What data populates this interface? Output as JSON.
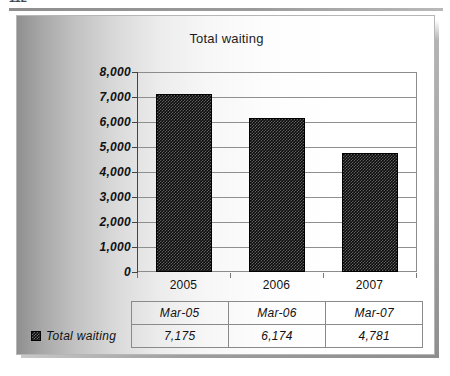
{
  "page": {
    "clipped_header_fragment": "112"
  },
  "chart_data": {
    "type": "bar",
    "title": "Total waiting",
    "xlabel": "",
    "ylabel": "",
    "categories": [
      "2005",
      "2006",
      "2007"
    ],
    "series": [
      {
        "name": "Total waiting",
        "values": [
          7175,
          6174,
          4781
        ],
        "value_labels": [
          "7,175",
          "6,174",
          "4,781"
        ],
        "color": "#0b0b0b",
        "pattern": "checkered"
      }
    ],
    "ylim": [
      0,
      8000
    ],
    "ytick_labels": [
      "8,000",
      "7,000",
      "6,000",
      "5,000",
      "4,000",
      "3,000",
      "2,000",
      "1,000",
      "0"
    ],
    "ytick_values": [
      8000,
      7000,
      6000,
      5000,
      4000,
      3000,
      2000,
      1000,
      0
    ],
    "grid": true,
    "legend_position": "table-left"
  },
  "data_table": {
    "corner_label": "",
    "columns": [
      "Mar-05",
      "Mar-06",
      "Mar-07"
    ],
    "rows": [
      {
        "label": "Total waiting",
        "marker": "series-swatch",
        "values": [
          "7,175",
          "6,174",
          "4,781"
        ]
      }
    ]
  }
}
